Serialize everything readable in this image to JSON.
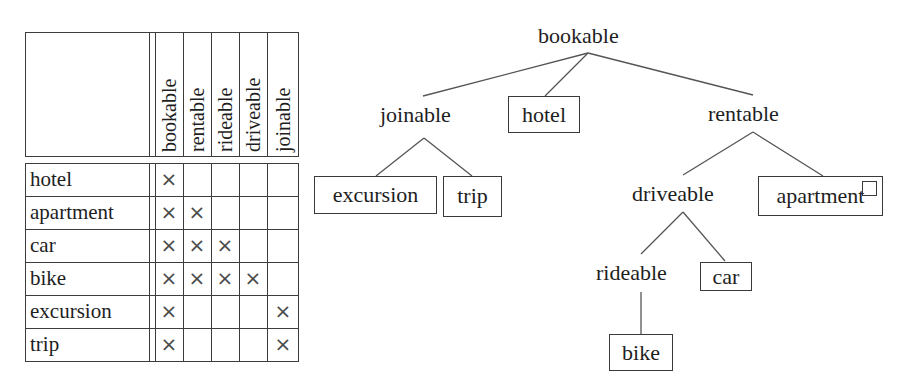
{
  "table": {
    "columns": [
      "bookable",
      "rentable",
      "rideable",
      "driveable",
      "joinable"
    ],
    "rows": [
      {
        "label": "hotel",
        "marks": [
          "×",
          "",
          "",
          "",
          ""
        ]
      },
      {
        "label": "apartment",
        "marks": [
          "×",
          "×",
          "",
          "",
          ""
        ]
      },
      {
        "label": "car",
        "marks": [
          "×",
          "×",
          "×",
          "",
          ""
        ]
      },
      {
        "label": "bike",
        "marks": [
          "×",
          "×",
          "×",
          "×",
          ""
        ]
      },
      {
        "label": "excursion",
        "marks": [
          "×",
          "",
          "",
          "",
          "×"
        ]
      },
      {
        "label": "trip",
        "marks": [
          "×",
          "",
          "",
          "",
          "×"
        ]
      }
    ]
  },
  "tree": {
    "root": "bookable",
    "joinable": "joinable",
    "hotel": "hotel",
    "rentable": "rentable",
    "excursion": "excursion",
    "trip": "trip",
    "driveable": "driveable",
    "apartment": "apartment",
    "rideable": "rideable",
    "car": "car",
    "bike": "bike",
    "edges": [
      [
        "bookable",
        "joinable"
      ],
      [
        "bookable",
        "hotel"
      ],
      [
        "bookable",
        "rentable"
      ],
      [
        "joinable",
        "excursion"
      ],
      [
        "joinable",
        "trip"
      ],
      [
        "rentable",
        "driveable"
      ],
      [
        "rentable",
        "apartment"
      ],
      [
        "driveable",
        "rideable"
      ],
      [
        "driveable",
        "car"
      ],
      [
        "rideable",
        "bike"
      ]
    ],
    "boxed_nodes": [
      "hotel",
      "excursion",
      "trip",
      "apartment",
      "car",
      "bike"
    ]
  }
}
